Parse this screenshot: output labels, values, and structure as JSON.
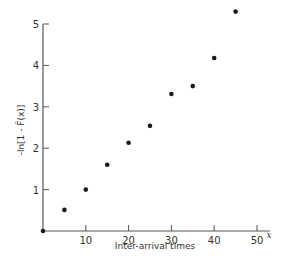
{
  "chart_data": {
    "type": "scatter",
    "title": "",
    "xlabel": "Inter-arrival times",
    "x_variable": "x",
    "ylabel": "-ln[1 - F̂(x)]",
    "xlim": [
      0,
      55
    ],
    "ylim": [
      0,
      5.3
    ],
    "xticks": [
      10,
      20,
      30,
      40,
      50
    ],
    "yticks": [
      1,
      2,
      3,
      4,
      5
    ],
    "grid": false,
    "legend": null,
    "series": [
      {
        "name": "empirical",
        "x": [
          0,
          5,
          10,
          15,
          20,
          25,
          30,
          35,
          40,
          45
        ],
        "y": [
          0,
          0.51,
          1.0,
          1.6,
          2.13,
          2.54,
          3.31,
          3.5,
          4.18,
          5.3
        ]
      }
    ]
  },
  "colors": {
    "axis": "#555555",
    "point": "#1a1a1a",
    "background": "#ffffff"
  }
}
